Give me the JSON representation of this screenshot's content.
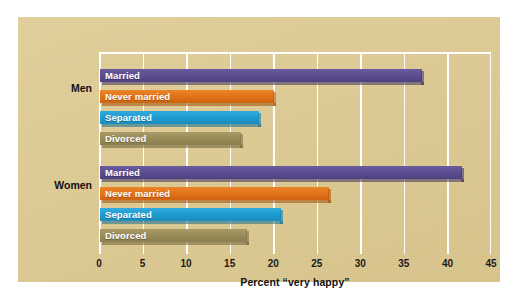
{
  "chart_data": {
    "type": "bar",
    "orientation": "horizontal",
    "title": "",
    "xlabel": "Percent “very happy”",
    "ylabel": "",
    "xlim": [
      0,
      45
    ],
    "xticks": [
      0,
      5,
      10,
      15,
      20,
      25,
      30,
      35,
      40,
      45
    ],
    "xtick_labels": [
      "0",
      "5",
      "10",
      "15",
      "20",
      "25",
      "30",
      "35",
      "40",
      "45"
    ],
    "grid": "vertical",
    "legend": "none",
    "categories": [
      "Married",
      "Never married",
      "Separated",
      "Divorced"
    ],
    "groups": [
      {
        "name": "Men",
        "bars": [
          {
            "label": "Married",
            "value": 37.0,
            "color": "#5d4f92",
            "color_name": "purple"
          },
          {
            "label": "Never married",
            "value": 20.0,
            "color": "#e2741a",
            "color_name": "orange"
          },
          {
            "label": "Separated",
            "value": 18.3,
            "color": "#1f9ed4",
            "color_name": "blue"
          },
          {
            "label": "Divorced",
            "value": 16.2,
            "color": "#9b8d5b",
            "color_name": "olive"
          }
        ]
      },
      {
        "name": "Women",
        "bars": [
          {
            "label": "Married",
            "value": 41.5,
            "color": "#5d4f92",
            "color_name": "purple"
          },
          {
            "label": "Never married",
            "value": 26.3,
            "color": "#e2741a",
            "color_name": "orange"
          },
          {
            "label": "Separated",
            "value": 20.8,
            "color": "#1f9ed4",
            "color_name": "blue"
          },
          {
            "label": "Divorced",
            "value": 16.9,
            "color": "#9b8d5b",
            "color_name": "olive"
          }
        ]
      }
    ]
  },
  "panel": {
    "background_color": "#decb93",
    "gridline_color": "#ffffff"
  },
  "axis": {
    "title": "Percent “very happy”",
    "ticks": [
      "0",
      "5",
      "10",
      "15",
      "20",
      "25",
      "30",
      "35",
      "40",
      "45"
    ]
  },
  "groups": {
    "men_label": "Men",
    "women_label": "Women"
  },
  "bars": {
    "men": {
      "married": "Married",
      "never_married": "Never married",
      "separated": "Separated",
      "divorced": "Divorced"
    },
    "women": {
      "married": "Married",
      "never_married": "Never married",
      "separated": "Separated",
      "divorced": "Divorced"
    }
  }
}
